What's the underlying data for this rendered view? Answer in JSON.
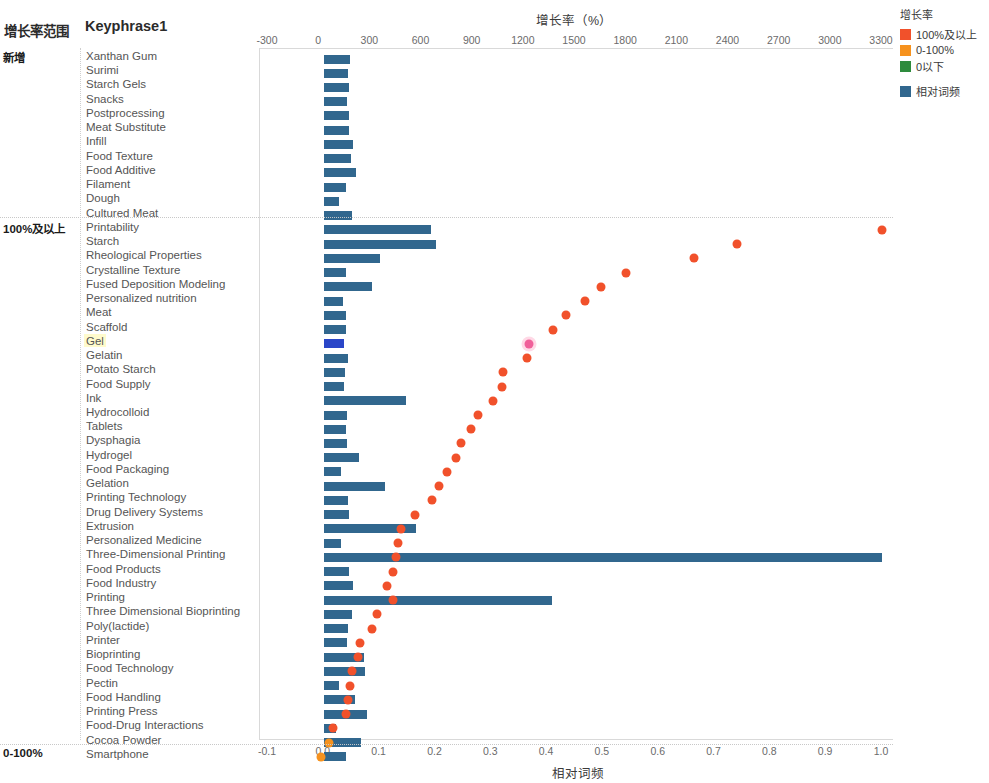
{
  "header": {
    "group_col_title": "增长率范围",
    "keyphrase_col_title": "Keyphrase1"
  },
  "axes": {
    "top_title": "增长率（%）",
    "top_ticks": [
      "-300",
      "0",
      "300",
      "600",
      "900",
      "1200",
      "1500",
      "1800",
      "2100",
      "2400",
      "2700",
      "3000",
      "3300"
    ],
    "bottom_title": "相对词频",
    "bottom_ticks": [
      "-0.1",
      "0.0",
      "0.1",
      "0.2",
      "0.3",
      "0.4",
      "0.5",
      "0.6",
      "0.7",
      "0.8",
      "0.9",
      "1.0"
    ]
  },
  "legend": {
    "title": "增长率",
    "items": [
      {
        "label": "100%及以上",
        "color": "#f1512b"
      },
      {
        "label": "0-100%",
        "color": "#f6921e"
      },
      {
        "label": "0以下",
        "color": "#2e8b3d"
      }
    ],
    "bar_item": {
      "label": "相对词频",
      "color": "#31678e"
    }
  },
  "groups": [
    {
      "label": "新增",
      "start": 0,
      "count": 12
    },
    {
      "label": "100%及以上",
      "start": 12,
      "count": 37
    },
    {
      "label": "0-100%",
      "start": 49,
      "count": 2
    }
  ],
  "chart_data": {
    "type": "bar",
    "xlabel": "相对词频",
    "ylabel": "Keyphrase1",
    "x2label": "增长率（%）",
    "xlim": [
      -0.1,
      1.0
    ],
    "x2lim": [
      -300,
      3300
    ],
    "grid": false,
    "legend_position": "right",
    "series": [
      {
        "name": "相对词频",
        "type": "bar",
        "color": "#31678e"
      },
      {
        "name": "增长率",
        "type": "scatter",
        "color": "#f1512b"
      }
    ],
    "categories": [
      "Xanthan Gum",
      "Surimi",
      "Starch Gels",
      "Snacks",
      "Postprocessing",
      "Meat Substitute",
      "Infill",
      "Food Texture",
      "Food Additive",
      "Filament",
      "Dough",
      "Cultured Meat",
      "Printability",
      "Starch",
      "Rheological Properties",
      "Crystalline Texture",
      "Fused Deposition Modeling",
      "Personalized nutrition",
      "Meat",
      "Scaffold",
      "Gel",
      "Gelatin",
      "Potato Starch",
      "Food Supply",
      "Ink",
      "Hydrocolloid",
      "Tablets",
      "Dysphagia",
      "Hydrogel",
      "Food Packaging",
      "Gelation",
      "Printing Technology",
      "Drug Delivery Systems",
      "Extrusion",
      "Personalized Medicine",
      "Three-Dimensional Printing",
      "Food Products",
      "Food Industry",
      "Printing",
      "Three Dimensional Bioprinting",
      "Poly(lactide)",
      "Printer",
      "Bioprinting",
      "Food Technology",
      "Pectin",
      "Food Handling",
      "Printing Press",
      "Food-Drug Interactions",
      "Cocoa Powder",
      "Smartphone"
    ],
    "relative_frequency": [
      0.047,
      0.043,
      0.045,
      0.042,
      0.046,
      0.046,
      0.052,
      0.049,
      0.057,
      0.04,
      0.027,
      0.05,
      0.192,
      0.201,
      0.101,
      0.039,
      0.086,
      0.034,
      0.04,
      0.04,
      0.036,
      0.043,
      0.038,
      0.036,
      0.148,
      0.042,
      0.04,
      0.041,
      0.063,
      0.03,
      0.11,
      0.043,
      0.045,
      0.166,
      0.03,
      1.0,
      0.046,
      0.052,
      0.409,
      0.05,
      0.044,
      0.041,
      0.072,
      0.074,
      0.028,
      0.056,
      0.078,
      0.022,
      0.067,
      0.04
    ],
    "growth_rate": [
      null,
      null,
      null,
      null,
      null,
      null,
      null,
      null,
      null,
      null,
      null,
      null,
      3300,
      2450,
      2200,
      1800,
      1650,
      1560,
      1450,
      1370,
      1230,
      1220,
      1080,
      1070,
      1020,
      930,
      890,
      830,
      800,
      750,
      700,
      660,
      560,
      480,
      460,
      450,
      430,
      400,
      430,
      340,
      310,
      240,
      230,
      190,
      180,
      170,
      160,
      80,
      60,
      10
    ],
    "categories_growth_bucket": [
      "新增",
      "新增",
      "新增",
      "新增",
      "新增",
      "新增",
      "新增",
      "新增",
      "新增",
      "新增",
      "新增",
      "新增",
      "100%及以上",
      "100%及以上",
      "100%及以上",
      "100%及以上",
      "100%及以上",
      "100%及以上",
      "100%及以上",
      "100%及以上",
      "100%及以上",
      "100%及以上",
      "100%及以上",
      "100%及以上",
      "100%及以上",
      "100%及以上",
      "100%及以上",
      "100%及以上",
      "100%及以上",
      "100%及以上",
      "100%及以上",
      "100%及以上",
      "100%及以上",
      "100%及以上",
      "100%及以上",
      "100%及以上",
      "100%及以上",
      "100%及以上",
      "100%及以上",
      "100%及以上",
      "100%及以上",
      "100%及以上",
      "100%及以上",
      "100%及以上",
      "100%及以上",
      "100%及以上",
      "100%及以上",
      "100%及以上",
      "0-100%",
      "0-100%"
    ],
    "selected_category": "Gel"
  }
}
